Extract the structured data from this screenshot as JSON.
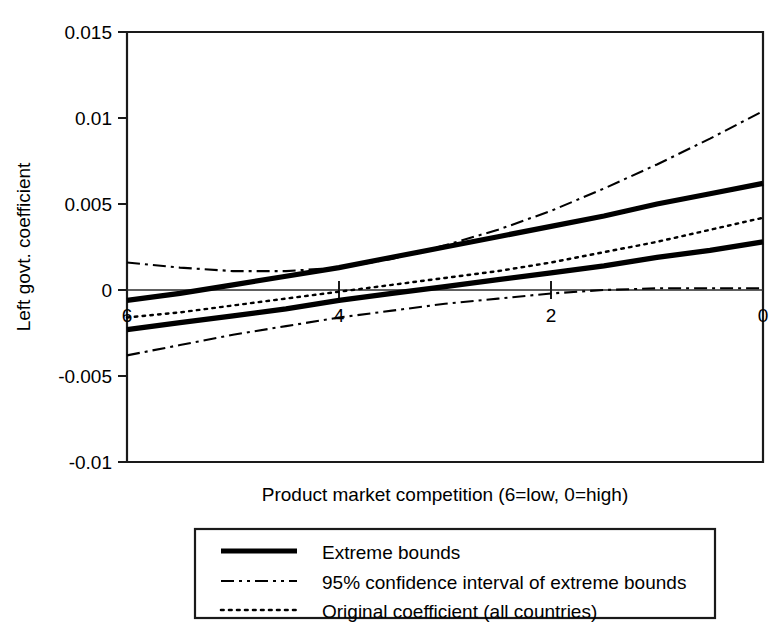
{
  "chart_data": {
    "type": "line",
    "title": "",
    "xlabel": "Product market competition (6=low, 0=high)",
    "ylabel": "Left govt. coefficient",
    "xlim": [
      6,
      0
    ],
    "ylim": [
      -0.01,
      0.015
    ],
    "x_ticks": [
      6,
      4,
      2,
      0
    ],
    "x_tick_labels": [
      "6",
      "4",
      "2",
      "0"
    ],
    "y_ticks": [
      -0.01,
      -0.005,
      0,
      0.005,
      0.01,
      0.015
    ],
    "y_tick_labels": [
      "-0.01",
      "-0.005",
      "0",
      "0.005",
      "0.01",
      "0.015"
    ],
    "grid": false,
    "legend_position": "below-center",
    "x_axis_inverted": true,
    "zero_reference_line": true,
    "x": [
      6.0,
      5.5,
      5.0,
      4.5,
      4.0,
      3.5,
      3.0,
      2.5,
      2.0,
      1.5,
      1.0,
      0.5,
      0.0
    ],
    "series": [
      {
        "name": "Extreme bounds (upper)",
        "style": "solid-thick",
        "values": [
          -0.0006,
          -0.0002,
          0.0003,
          0.0008,
          0.0013,
          0.0019,
          0.0025,
          0.0031,
          0.0037,
          0.0043,
          0.005,
          0.0056,
          0.0062
        ]
      },
      {
        "name": "Extreme bounds (lower)",
        "style": "solid-thick",
        "values": [
          -0.0023,
          -0.0019,
          -0.0015,
          -0.0011,
          -0.0006,
          -0.0002,
          0.0002,
          0.0006,
          0.001,
          0.0014,
          0.0019,
          0.0023,
          0.0028
        ]
      },
      {
        "name": "95% confidence interval of extreme bounds (upper)",
        "style": "dash-dot",
        "values": [
          0.0016,
          0.0013,
          0.0011,
          0.0011,
          0.0013,
          0.0018,
          0.0026,
          0.0035,
          0.0046,
          0.0059,
          0.0073,
          0.0088,
          0.0104
        ]
      },
      {
        "name": "95% confidence interval of extreme bounds (lower)",
        "style": "dash-dot",
        "values": [
          -0.0038,
          -0.0032,
          -0.0026,
          -0.0021,
          -0.0016,
          -0.0012,
          -0.0008,
          -0.0005,
          -0.0002,
          0.0,
          0.0001,
          0.0001,
          0.0001
        ]
      },
      {
        "name": "Original coefficient (all countries)",
        "style": "dotted",
        "values": [
          -0.0016,
          -0.0013,
          -0.0009,
          -0.0005,
          -0.0001,
          0.0003,
          0.0007,
          0.0011,
          0.0016,
          0.0022,
          0.0028,
          0.0035,
          0.0042
        ]
      }
    ],
    "legend": [
      {
        "label": "Extreme bounds",
        "style": "solid-thick"
      },
      {
        "label": "95% confidence interval of extreme bounds",
        "style": "dash-dot"
      },
      {
        "label": "Original coefficient (all countries)",
        "style": "dotted"
      }
    ]
  }
}
